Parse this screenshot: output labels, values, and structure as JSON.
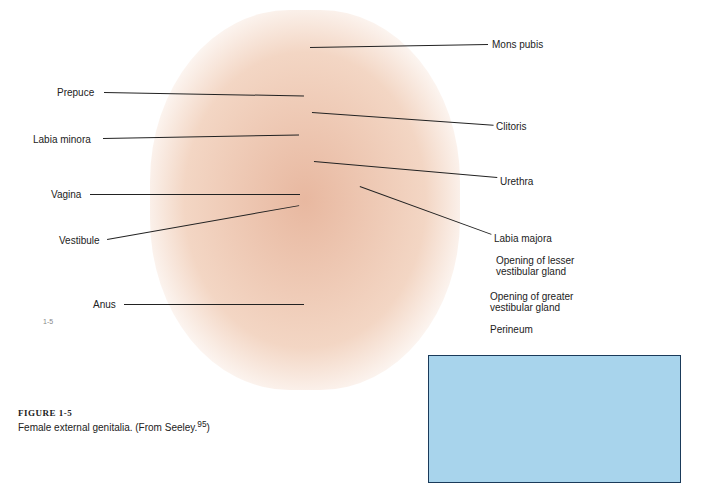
{
  "figure": {
    "number_label": "FIGURE 1-5",
    "caption": "Female external genitalia. (From Seeley.",
    "citation_superscript": "95",
    "caption_close": ")"
  },
  "labels_left": [
    {
      "id": "prepuce",
      "text": "Prepuce"
    },
    {
      "id": "labia-minora",
      "text": "Labia minora"
    },
    {
      "id": "vagina",
      "text": "Vagina"
    },
    {
      "id": "vestibule",
      "text": "Vestibule"
    },
    {
      "id": "anus",
      "text": "Anus"
    }
  ],
  "labels_right": [
    {
      "id": "mons-pubis",
      "text": "Mons pubis"
    },
    {
      "id": "clitoris",
      "text": "Clitoris"
    },
    {
      "id": "urethra",
      "text": "Urethra"
    },
    {
      "id": "labia-majora",
      "text": "Labia majora"
    },
    {
      "id": "lesser-gland-1",
      "text": "Opening of lesser"
    },
    {
      "id": "lesser-gland-2",
      "text": "vestibular gland"
    },
    {
      "id": "greater-gland-1",
      "text": "Opening of greater"
    },
    {
      "id": "greater-gland-2",
      "text": "vestibular gland"
    },
    {
      "id": "perineum",
      "text": "Perineum"
    }
  ],
  "page_mark": "1-5"
}
